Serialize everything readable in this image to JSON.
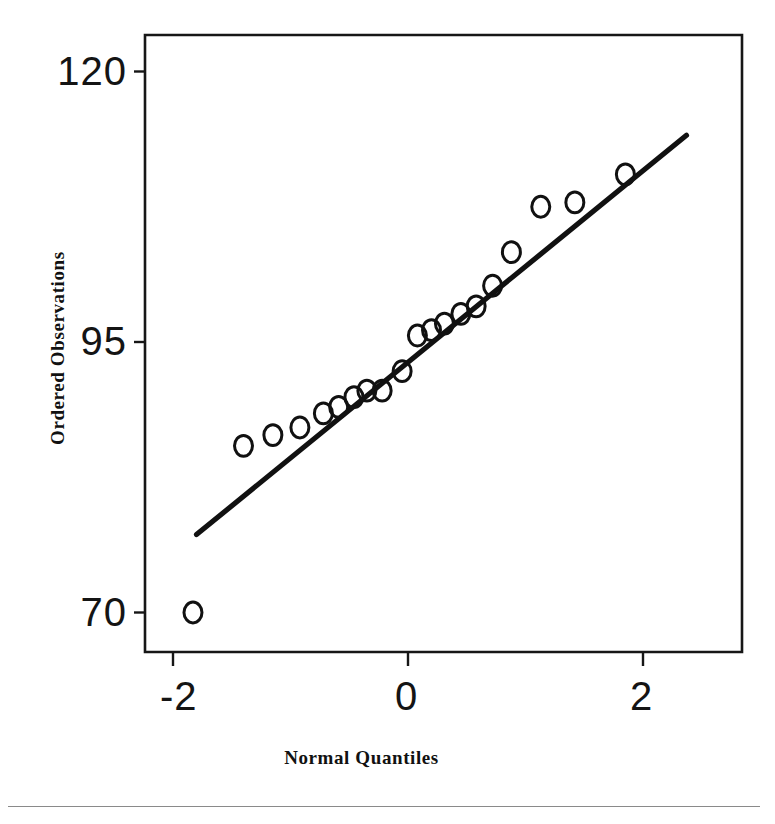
{
  "figure": {
    "kind": "normal-quantile-quantile-plot",
    "background_color": "#ffffff",
    "ink_color": "#141414",
    "frame": {
      "left_px": 145,
      "top_px": 35,
      "right_px": 742,
      "bottom_px": 652
    }
  },
  "axes": {
    "x_title": "Normal Quantiles",
    "y_title": "Ordered Observations",
    "x_ticks": [
      {
        "label": "-2",
        "value": -2
      },
      {
        "label": "0",
        "value": 0
      },
      {
        "label": "2",
        "value": 2
      }
    ],
    "y_ticks": [
      {
        "label": "120",
        "value": 120
      },
      {
        "label": "95",
        "value": 95
      },
      {
        "label": "70",
        "value": 70
      }
    ]
  },
  "chart_data": {
    "type": "scatter",
    "title": "",
    "subtitle": "",
    "xlabel": "Normal Quantiles",
    "ylabel": "Ordered Observations",
    "xlim": [
      -2.24,
      2.84
    ],
    "ylim": [
      62.6,
      119.7
    ],
    "grid": false,
    "legend": "none",
    "marker": "open-circle",
    "x_tick_values": [
      -2,
      0,
      2
    ],
    "x_tick_labels": [
      "-2",
      "0",
      "2"
    ],
    "y_tick_values": [
      70,
      95,
      120
    ],
    "y_tick_labels": [
      "70",
      "95",
      "120"
    ],
    "series": [
      {
        "name": "Ordered Observations",
        "type": "scatter",
        "points": [
          {
            "x": -1.83,
            "y": 70.0
          },
          {
            "x": -1.4,
            "y": 85.4
          },
          {
            "x": -1.15,
            "y": 86.4
          },
          {
            "x": -0.92,
            "y": 87.1
          },
          {
            "x": -0.72,
            "y": 88.4
          },
          {
            "x": -0.59,
            "y": 89.0
          },
          {
            "x": -0.46,
            "y": 89.9
          },
          {
            "x": -0.35,
            "y": 90.5
          },
          {
            "x": -0.22,
            "y": 90.5
          },
          {
            "x": -0.05,
            "y": 92.3
          },
          {
            "x": 0.08,
            "y": 95.6
          },
          {
            "x": 0.2,
            "y": 96.1
          },
          {
            "x": 0.31,
            "y": 96.7
          },
          {
            "x": 0.45,
            "y": 97.6
          },
          {
            "x": 0.58,
            "y": 98.3
          },
          {
            "x": 0.72,
            "y": 100.2
          },
          {
            "x": 0.88,
            "y": 103.3
          },
          {
            "x": 1.13,
            "y": 107.5
          },
          {
            "x": 1.42,
            "y": 107.9
          },
          {
            "x": 1.85,
            "y": 110.5
          }
        ]
      },
      {
        "name": "Reference Line",
        "type": "line",
        "endpoints": [
          {
            "x": -1.8,
            "y": 77.2
          },
          {
            "x": 2.37,
            "y": 114.1
          }
        ]
      }
    ]
  }
}
